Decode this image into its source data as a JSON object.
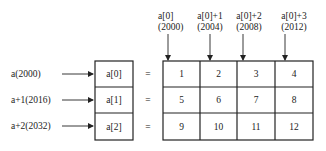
{
  "diagram": {
    "type": "2d-array-memory-layout",
    "row_pointers": [
      {
        "label": "a(2000)",
        "target": "a[0]"
      },
      {
        "label": "a+1(2016)",
        "target": "a[1]"
      },
      {
        "label": "a+2(2032)",
        "target": "a[2]"
      }
    ],
    "row_boxes": [
      "a[0]",
      "a[1]",
      "a[2]"
    ],
    "equals_sign": "=",
    "column_pointers": [
      {
        "line1": "a[0]",
        "line2": "(2000)"
      },
      {
        "line1": "a[0]+1",
        "line2": "(2004)"
      },
      {
        "line1": "a[0]+2",
        "line2": "(2008)"
      },
      {
        "line1": "a[0]+3",
        "line2": "(2012)"
      }
    ],
    "matrix": [
      [
        "1",
        "2",
        "3",
        "4"
      ],
      [
        "5",
        "6",
        "7",
        "8"
      ],
      [
        "9",
        "10",
        "11",
        "12"
      ]
    ],
    "colors": {
      "line": "#222222",
      "background": "#ffffff"
    }
  }
}
